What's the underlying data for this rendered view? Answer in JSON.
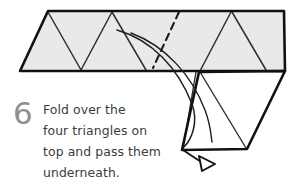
{
  "figure": {
    "type": "origami-instruction-diagram",
    "step_number": "6",
    "caption": "Fold over the\nfour triangles on\ntop and pass them\nunderneath.",
    "caption_lines": [
      "Fold over the",
      "four triangles on",
      "top and pass them",
      "underneath."
    ],
    "colors": {
      "paper_fill": "#e9e9e9",
      "paper_fill_white": "#ffffff",
      "outline": "#111111",
      "crease_line": "#2e2e2e",
      "dashed_fold": "#1a1a1a",
      "arrow": "#1a1a1a",
      "step_number": "#8f8f8f",
      "caption_text": "#3b3b3b",
      "background": "#ffffff"
    },
    "shapes": {
      "band": {
        "name": "shaded-paper-band",
        "points": "48,11 284,11 285,71 20,71",
        "fill": "#e9e9e9"
      },
      "right_flap": {
        "name": "lower-white-flap",
        "points": "199,71 285,71 247,149 182,150"
      },
      "creases": [
        "48,11 80,70",
        "80,70 112,11",
        "112,11 145,70",
        "199,71 232,12",
        "232,12 265,70",
        "199,71 231,11"
      ],
      "dashed_fold": "178,12 152,68",
      "motion_arrow_curve": "118,30 168,52 196,110 185,146",
      "secondary_curve": "132,34 178,60 206,104 213,140",
      "arrowhead": "171,155 184,152 176,166"
    }
  }
}
